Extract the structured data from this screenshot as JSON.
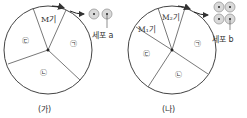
{
  "diagrams": [
    {
      "caption": "(가)",
      "phase_labels": {
        "m": "M기",
        "a": "㉠",
        "b": "㉡",
        "c": "㉢"
      },
      "cell_label": "세포 a",
      "cell_count": 2
    },
    {
      "caption": "(나)",
      "phase_labels": {
        "m1": "M₁기",
        "m2": "M₂기",
        "a": "㉠",
        "b": "㉡",
        "c": "㉢"
      },
      "cell_label": "세포 b",
      "cell_count": 4
    }
  ],
  "colors": {
    "line": "#444444",
    "cell_fill": "#d9d9d9",
    "cell_stroke": "#999999"
  }
}
